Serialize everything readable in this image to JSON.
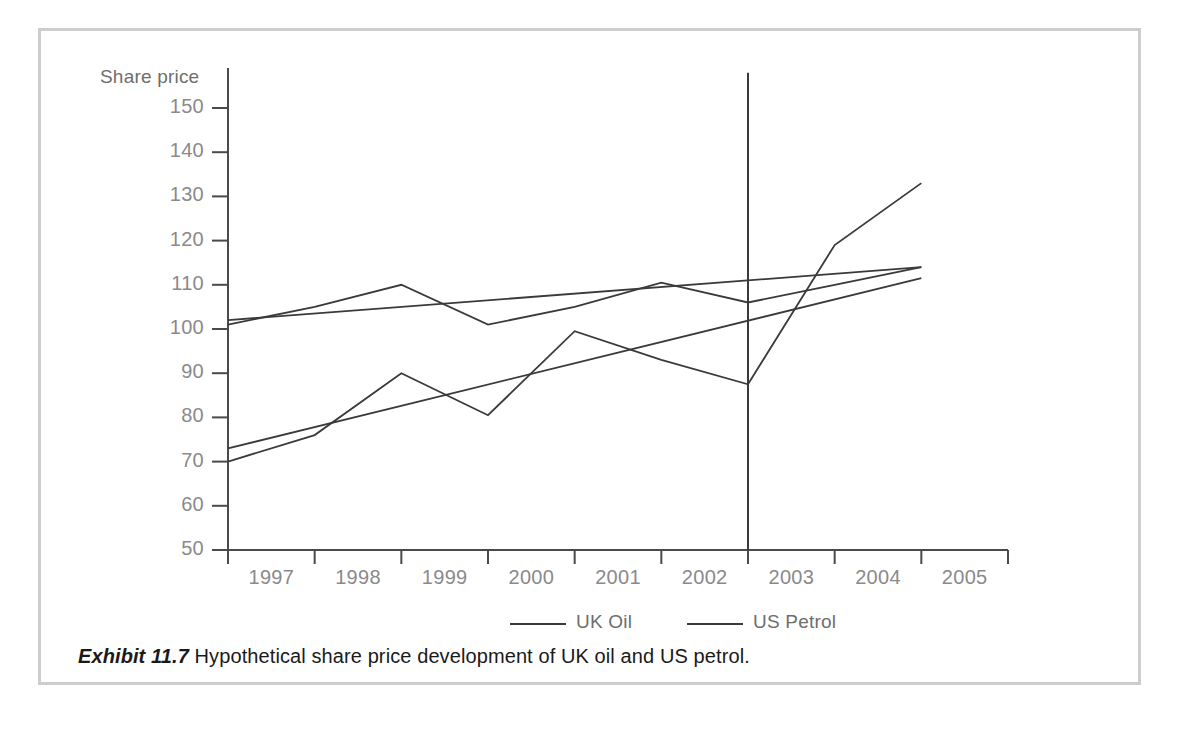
{
  "caption": {
    "tag": "Exhibit 11.7",
    "text": "Hypothetical share price development of UK oil and US petrol."
  },
  "chart_data": {
    "type": "line",
    "title": "",
    "subtitle": "",
    "xlabel": "",
    "ylabel": "Share price",
    "ylim": [
      50,
      150
    ],
    "yticks": [
      50,
      60,
      70,
      80,
      90,
      100,
      110,
      120,
      130,
      140,
      150
    ],
    "categories": [
      "1997",
      "1998",
      "1999",
      "2000",
      "2001",
      "2002",
      "2003",
      "2004",
      "2005"
    ],
    "grid": false,
    "legend_position": "bottom",
    "series": [
      {
        "name": "UK Oil",
        "color": "#3a3a3a",
        "values": [
          70,
          76,
          90,
          80.5,
          99.5,
          93,
          87.5,
          119,
          133
        ]
      },
      {
        "name": "US Petrol",
        "color": "#3a3a3a",
        "values": [
          101,
          105,
          110,
          101,
          105,
          110.5,
          106,
          110,
          114
        ]
      }
    ],
    "trendlines": [
      {
        "name": "UK Oil trend",
        "color": "#3a3a3a",
        "start_value": 73,
        "end_value": 111.5
      },
      {
        "name": "US Petrol trend",
        "color": "#3a3a3a",
        "start_value": 102,
        "end_value": 114
      }
    ],
    "annotations": [
      {
        "name": "forecast-divider",
        "type": "vertical-line",
        "position_between": [
          "2002",
          "2003"
        ],
        "top_value": 158,
        "bottom_value": 50
      }
    ]
  },
  "legend": {
    "items": [
      {
        "label": "UK Oil"
      },
      {
        "label": "US Petrol"
      }
    ]
  }
}
